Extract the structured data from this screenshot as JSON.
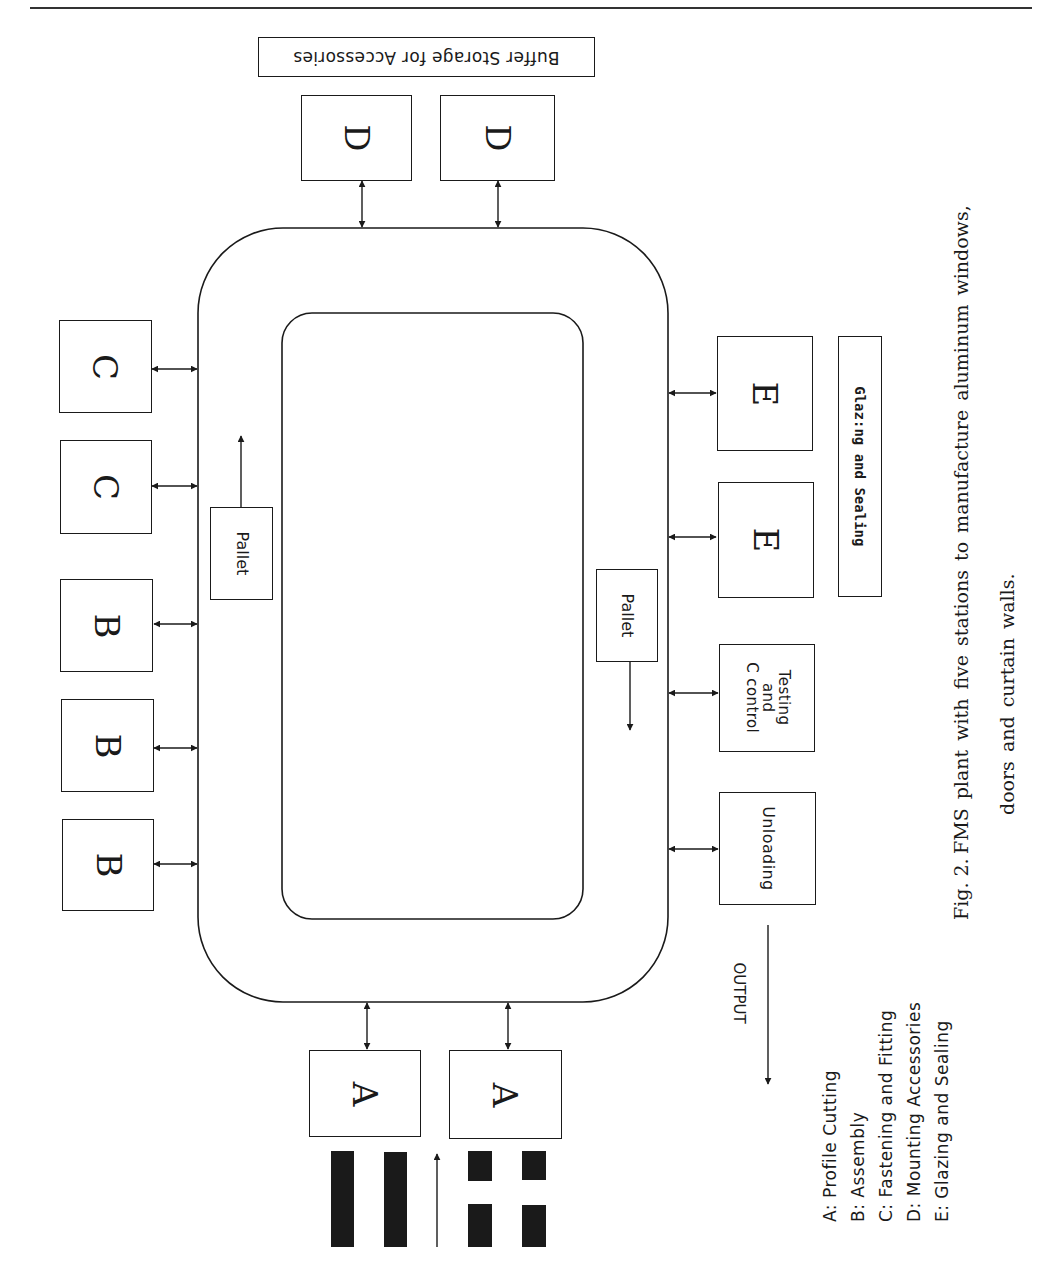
{
  "figure": {
    "caption_label": "Fig. 2.",
    "caption_line1": "FMS plant with five stations to manufacture aluminum windows,",
    "caption_line2": "doors and curtain walls."
  },
  "diagram": {
    "buffer_label": "Buffer Storage for Accessories",
    "glazing_label": "Glaz:ng and Sealing",
    "output_label": "OUTPUT",
    "pallet_left": "Pallet",
    "pallet_right": "Pallet",
    "testing_label_line1": "Testing",
    "testing_label_line2": "and",
    "testing_label_line3": "C control",
    "unloading_label": "Unloading",
    "stations": {
      "d1": "D",
      "d2": "D",
      "c1": "C",
      "c2": "C",
      "b1": "B",
      "b2": "B",
      "b3": "B",
      "e1": "E",
      "e2": "E",
      "a1": "A",
      "a2": "A"
    }
  },
  "legend": {
    "items": [
      "A: Profile Cutting",
      "B: Assembly",
      "C: Fastening and Fitting",
      "D: Mounting Accessories",
      "E: Glazing and Sealing"
    ]
  }
}
